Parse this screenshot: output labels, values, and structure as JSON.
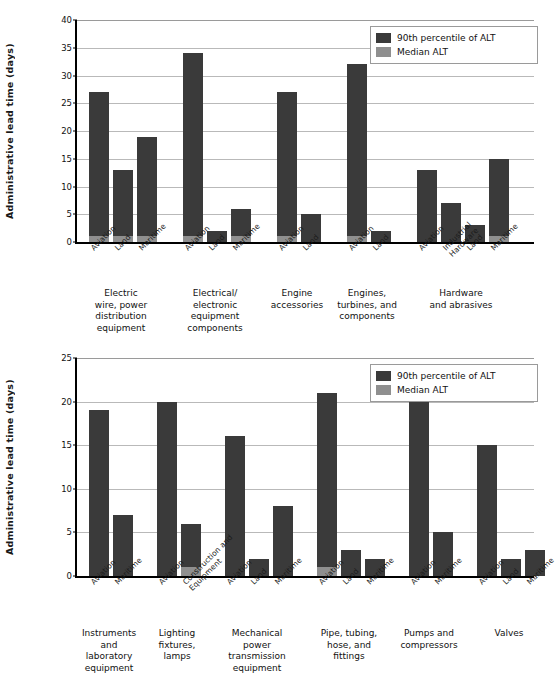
{
  "legend": {
    "p90_label": "90th percentile of ALT",
    "median_label": "Median ALT",
    "p90_color": "#3a3a3a",
    "median_color": "#8f8f8f"
  },
  "chart_data": [
    {
      "type": "bar",
      "id": "top",
      "title": "",
      "xlabel": "",
      "ylabel": "Administrative lead time (days)",
      "ylim": [
        0,
        40
      ],
      "yticks": [
        0,
        5,
        10,
        15,
        20,
        25,
        30,
        35,
        40
      ],
      "grid": true,
      "legend_position": "top-right",
      "series_names": [
        "90th percentile of ALT",
        "Median ALT"
      ],
      "groups": [
        {
          "category": "Electric wire, power distribution equipment",
          "category_lines": [
            "Electric",
            "wire, power",
            "distribution",
            "equipment"
          ],
          "bars": [
            {
              "label": "Aviation",
              "label_lines": [
                "Aviation"
              ],
              "p90": 27,
              "median": 1
            },
            {
              "label": "Land",
              "label_lines": [
                "Land"
              ],
              "p90": 13,
              "median": 1
            },
            {
              "label": "Maritime",
              "label_lines": [
                "Maritime"
              ],
              "p90": 19,
              "median": 1
            }
          ]
        },
        {
          "category": "Electrical/electronic equipment components",
          "category_lines": [
            "Electrical/",
            "electronic",
            "equipment",
            "components"
          ],
          "bars": [
            {
              "label": "Aviation",
              "label_lines": [
                "Aviation"
              ],
              "p90": 34,
              "median": 1
            },
            {
              "label": "Land",
              "label_lines": [
                "Land"
              ],
              "p90": 2,
              "median": 0
            },
            {
              "label": "Maritime",
              "label_lines": [
                "Maritime"
              ],
              "p90": 6,
              "median": 1
            }
          ]
        },
        {
          "category": "Engine accessories",
          "category_lines": [
            "Engine",
            "accessories"
          ],
          "bars": [
            {
              "label": "Aviation",
              "label_lines": [
                "Aviation"
              ],
              "p90": 27,
              "median": 1
            },
            {
              "label": "Land",
              "label_lines": [
                "Land"
              ],
              "p90": 5,
              "median": 0
            }
          ]
        },
        {
          "category": "Engines, turbines, and components",
          "category_lines": [
            "Engines,",
            "turbines, and",
            "components"
          ],
          "bars": [
            {
              "label": "Aviation",
              "label_lines": [
                "Aviation"
              ],
              "p90": 32,
              "median": 1
            },
            {
              "label": "Land",
              "label_lines": [
                "Land"
              ],
              "p90": 2,
              "median": 0
            }
          ]
        },
        {
          "category": "Hardware and abrasives",
          "category_lines": [
            "Hardware",
            "and abrasives"
          ],
          "bars": [
            {
              "label": "Aviation",
              "label_lines": [
                "Aviation"
              ],
              "p90": 13,
              "median": 0
            },
            {
              "label": "Industrial Hardware",
              "label_lines": [
                "Industrial",
                "Hardware"
              ],
              "p90": 7,
              "median": 0
            },
            {
              "label": "Land",
              "label_lines": [
                "Land"
              ],
              "p90": 3,
              "median": 0
            },
            {
              "label": "Maritime",
              "label_lines": [
                "Maritime"
              ],
              "p90": 15,
              "median": 1
            }
          ]
        }
      ]
    },
    {
      "type": "bar",
      "id": "bottom",
      "title": "",
      "xlabel": "",
      "ylabel": "Administrative lead time (days)",
      "ylim": [
        0,
        25
      ],
      "yticks": [
        0,
        5,
        10,
        15,
        20,
        25
      ],
      "grid": true,
      "legend_position": "top-right",
      "series_names": [
        "90th percentile of ALT",
        "Median ALT"
      ],
      "groups": [
        {
          "category": "Instruments and laboratory equipment",
          "category_lines": [
            "Instruments",
            "and",
            "laboratory",
            "equipment"
          ],
          "bars": [
            {
              "label": "Aviation",
              "label_lines": [
                "Aviation"
              ],
              "p90": 19,
              "median": 0
            },
            {
              "label": "Maritime",
              "label_lines": [
                "Maritime"
              ],
              "p90": 7,
              "median": 0
            }
          ]
        },
        {
          "category": "Lighting fixtures, lamps",
          "category_lines": [
            "Lighting",
            "fixtures,",
            "lamps"
          ],
          "bars": [
            {
              "label": "Aviation",
              "label_lines": [
                "Aviation"
              ],
              "p90": 20,
              "median": 0
            },
            {
              "label": "Construction and Equipment",
              "label_lines": [
                "Construction and",
                "Equipment"
              ],
              "p90": 6,
              "median": 1
            }
          ]
        },
        {
          "category": "Mechanical power transmission equipment",
          "category_lines": [
            "Mechanical",
            "power",
            "transmission",
            "equipment"
          ],
          "bars": [
            {
              "label": "Aviation",
              "label_lines": [
                "Aviation"
              ],
              "p90": 16,
              "median": 0
            },
            {
              "label": "Land",
              "label_lines": [
                "Land"
              ],
              "p90": 2,
              "median": 0
            },
            {
              "label": "Maritime",
              "label_lines": [
                "Maritime"
              ],
              "p90": 8,
              "median": 0
            }
          ]
        },
        {
          "category": "Pipe, tubing, hose, and fittings",
          "category_lines": [
            "Pipe, tubing,",
            "hose, and",
            "fittings"
          ],
          "bars": [
            {
              "label": "Aviation",
              "label_lines": [
                "Aviation"
              ],
              "p90": 21,
              "median": 1
            },
            {
              "label": "Land",
              "label_lines": [
                "Land"
              ],
              "p90": 3,
              "median": 0
            },
            {
              "label": "Maritime",
              "label_lines": [
                "Maritime"
              ],
              "p90": 2,
              "median": 0
            }
          ]
        },
        {
          "category": "Pumps and compressors",
          "category_lines": [
            "Pumps and",
            "compressors"
          ],
          "bars": [
            {
              "label": "Aviation",
              "label_lines": [
                "Aviation"
              ],
              "p90": 21,
              "median": 0
            },
            {
              "label": "Maritime",
              "label_lines": [
                "Maritime"
              ],
              "p90": 5,
              "median": 0
            }
          ]
        },
        {
          "category": "Valves",
          "category_lines": [
            "Valves"
          ],
          "bars": [
            {
              "label": "Aviation",
              "label_lines": [
                "Aviation"
              ],
              "p90": 15,
              "median": 0
            },
            {
              "label": "Land",
              "label_lines": [
                "Land"
              ],
              "p90": 2,
              "median": 0
            },
            {
              "label": "Maritime",
              "label_lines": [
                "Maritime"
              ],
              "p90": 3,
              "median": 0
            }
          ]
        }
      ]
    }
  ]
}
